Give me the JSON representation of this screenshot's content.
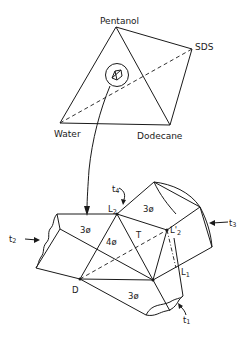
{
  "tetrahedron": {
    "vertices": {
      "top": "Pentanol",
      "right": "SDS",
      "left": "Water",
      "bottom_right": "Dodecane"
    }
  },
  "detail": {
    "points": {
      "L2": "L",
      "L2_sub": "2",
      "L2prime": "L'",
      "L2prime_sub": "2",
      "L1": "L",
      "L1_sub": "1",
      "D": "D",
      "T": "T"
    },
    "tie_labels": {
      "t1": "t",
      "t1_sub": "1",
      "t2": "t",
      "t2_sub": "2",
      "t3": "t",
      "t3_sub": "3",
      "t4": "t",
      "t4_sub": "4"
    },
    "regions": {
      "three_phase_left": "3ø",
      "three_phase_top_right": "3ø",
      "three_phase_bottom": "3ø",
      "four_phase": "4ø"
    }
  },
  "colors": {
    "line": "#1a1a1a",
    "background": "#ffffff"
  }
}
